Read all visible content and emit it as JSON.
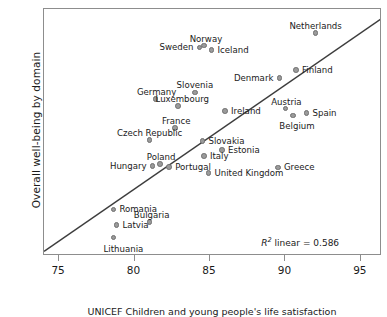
{
  "chart_data": {
    "type": "scatter",
    "title": "",
    "xlabel": "UNICEF Children and young people's life satisfaction",
    "ylabel": "Overall well-being by domain",
    "xlim": [
      74,
      96.4
    ],
    "ylim": [
      79.2,
      121.6
    ],
    "xticks": [
      75,
      80,
      85,
      90,
      95
    ],
    "yticks": [
      80,
      90,
      100,
      110,
      120
    ],
    "grid": false,
    "legend": "none",
    "annotation": {
      "text_prefix": "R",
      "text_sup": "2",
      "text_suffix": " linear = 0.586",
      "r_squared": 0.586,
      "full_text": "R2 linear = 0.586"
    },
    "trendline": {
      "type": "linear",
      "x": [
        74.0,
        96.4
      ],
      "y": [
        80.0,
        120.0
      ],
      "color": "#3d3d3d"
    },
    "marker_color": "#9a9a9a",
    "marker_edge_color": "#6f6f6f",
    "points": [
      {
        "label": "Netherlands",
        "x": 92.0,
        "y": 117.5,
        "lpos": "c",
        "ldx": 0,
        "ldy": -11
      },
      {
        "label": "Norway",
        "x": 84.6,
        "y": 115.3,
        "lpos": "c",
        "ldx": 2,
        "ldy": -11
      },
      {
        "label": "Sweden",
        "x": 84.3,
        "y": 115.0,
        "lpos": "l",
        "ldx": -6,
        "ldy": 0
      },
      {
        "label": "Iceland",
        "x": 85.1,
        "y": 114.6,
        "lpos": "r",
        "ldx": 6,
        "ldy": 0
      },
      {
        "label": "Finland",
        "x": 90.7,
        "y": 111.1,
        "lpos": "r",
        "ldx": 6,
        "ldy": 0
      },
      {
        "label": "Denmark",
        "x": 89.6,
        "y": 109.8,
        "lpos": "l",
        "ldx": -6,
        "ldy": 0
      },
      {
        "label": "Slovenia",
        "x": 84.0,
        "y": 107.3,
        "lpos": "c",
        "ldx": 0,
        "ldy": -11
      },
      {
        "label": "Germany",
        "x": 81.4,
        "y": 106.2,
        "lpos": "c",
        "ldx": 1,
        "ldy": -11
      },
      {
        "label": "Luxembourg",
        "x": 82.9,
        "y": 104.9,
        "lpos": "c",
        "ldx": 4,
        "ldy": -11
      },
      {
        "label": "Austria",
        "x": 90.0,
        "y": 104.5,
        "lpos": "c",
        "ldx": 1,
        "ldy": -11
      },
      {
        "label": "Ireland",
        "x": 86.0,
        "y": 104.1,
        "lpos": "r",
        "ldx": 6,
        "ldy": 0
      },
      {
        "label": "Spain",
        "x": 91.4,
        "y": 103.7,
        "lpos": "r",
        "ldx": 6,
        "ldy": 0
      },
      {
        "label": "Belgium",
        "x": 90.5,
        "y": 103.3,
        "lpos": "c",
        "ldx": 4,
        "ldy": 6
      },
      {
        "label": "France",
        "x": 82.7,
        "y": 101.2,
        "lpos": "c",
        "ldx": 1,
        "ldy": -11
      },
      {
        "label": "Czech Republic",
        "x": 81.0,
        "y": 99.1,
        "lpos": "c",
        "ldx": 0,
        "ldy": -11
      },
      {
        "label": "Slovakia",
        "x": 84.5,
        "y": 98.9,
        "lpos": "r",
        "ldx": 6,
        "ldy": 0
      },
      {
        "label": "Estonia",
        "x": 85.8,
        "y": 97.4,
        "lpos": "r",
        "ldx": 6,
        "ldy": 0
      },
      {
        "label": "Italy",
        "x": 84.6,
        "y": 96.4,
        "lpos": "r",
        "ldx": 6,
        "ldy": 0
      },
      {
        "label": "Poland",
        "x": 81.7,
        "y": 95.0,
        "lpos": "c",
        "ldx": 1,
        "ldy": -11
      },
      {
        "label": "Hungary",
        "x": 81.2,
        "y": 94.6,
        "lpos": "l",
        "ldx": -6,
        "ldy": 0
      },
      {
        "label": "Portugal",
        "x": 82.3,
        "y": 94.5,
        "lpos": "r",
        "ldx": 6,
        "ldy": 0
      },
      {
        "label": "Greece",
        "x": 89.5,
        "y": 94.4,
        "lpos": "r",
        "ldx": 6,
        "ldy": 0
      },
      {
        "label": "United Kingdom",
        "x": 84.9,
        "y": 93.4,
        "lpos": "r",
        "ldx": 6,
        "ldy": 0
      },
      {
        "label": "Romania",
        "x": 78.6,
        "y": 87.2,
        "lpos": "r",
        "ldx": 6,
        "ldy": 0
      },
      {
        "label": "Bulgaria",
        "x": 81.0,
        "y": 85.0,
        "lpos": "c",
        "ldx": 2,
        "ldy": -11
      },
      {
        "label": "Latvia",
        "x": 78.8,
        "y": 84.5,
        "lpos": "r",
        "ldx": 6,
        "ldy": 0
      },
      {
        "label": "Lithuania",
        "x": 78.6,
        "y": 82.4,
        "lpos": "c",
        "ldx": 10,
        "ldy": 8
      }
    ]
  }
}
